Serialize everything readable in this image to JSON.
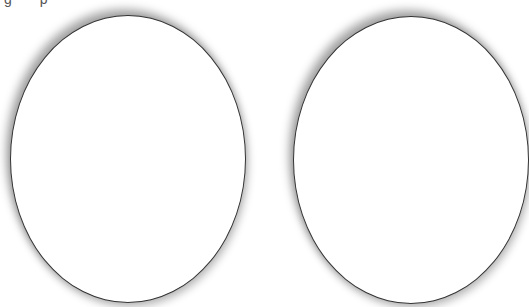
{
  "header_fragment": "g p",
  "shapes": [
    {
      "id": "oval-left",
      "type": "ellipse",
      "fill": "#ffffff",
      "stroke": "#333333"
    },
    {
      "id": "oval-right",
      "type": "ellipse",
      "fill": "#ffffff",
      "stroke": "#333333",
      "clipped": "right"
    }
  ]
}
